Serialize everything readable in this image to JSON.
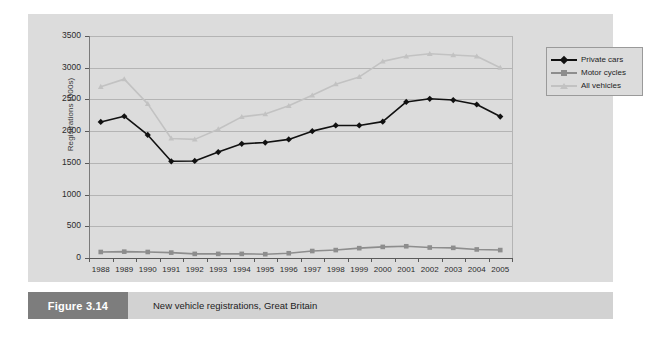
{
  "figure": {
    "number_label": "Figure 3.14",
    "caption": "New vehicle registrations, Great Britain"
  },
  "axes": {
    "ylabel": "Registrations (000s)",
    "xlabel": "",
    "yticks": [
      "0",
      "500",
      "1000",
      "1500",
      "2000",
      "2500",
      "3000",
      "3500"
    ]
  },
  "legend": {
    "position": "top-right",
    "entries": [
      {
        "label": "Private cars",
        "color": "#111111",
        "marker": "diamond"
      },
      {
        "label": "Motor cycles",
        "color": "#8d8d8d",
        "marker": "square"
      },
      {
        "label": "All vehicles",
        "color": "#c2c2c2",
        "marker": "triangle"
      }
    ]
  },
  "chart_data": {
    "type": "line",
    "title": "New vehicle registrations, Great Britain",
    "xlabel": "",
    "ylabel": "Registrations (000s)",
    "ylim": [
      0,
      3500
    ],
    "ytick_step": 500,
    "grid": true,
    "legend_position": "top-right",
    "categories": [
      "1988",
      "1989",
      "1990",
      "1991",
      "1992",
      "1993",
      "1994",
      "1995",
      "1996",
      "1997",
      "1998",
      "1999",
      "2000",
      "2001",
      "2002",
      "2003",
      "2004",
      "2005"
    ],
    "series": [
      {
        "name": "Private cars",
        "color": "#111111",
        "marker": "diamond",
        "values": [
          2145,
          2235,
          1940,
          1525,
          1530,
          1670,
          1800,
          1820,
          1870,
          2000,
          2090,
          2090,
          2150,
          2460,
          2510,
          2490,
          2420,
          2230
        ]
      },
      {
        "name": "Motor cycles",
        "color": "#8d8d8d",
        "marker": "square",
        "values": [
          95,
          100,
          95,
          85,
          65,
          65,
          65,
          60,
          75,
          110,
          125,
          155,
          175,
          185,
          165,
          160,
          135,
          125
        ]
      },
      {
        "name": "All vehicles",
        "color": "#c2c2c2",
        "marker": "triangle",
        "values": [
          2700,
          2820,
          2430,
          1885,
          1870,
          2030,
          2225,
          2270,
          2400,
          2565,
          2740,
          2855,
          3100,
          3180,
          3220,
          3200,
          3180,
          3000
        ]
      }
    ]
  }
}
